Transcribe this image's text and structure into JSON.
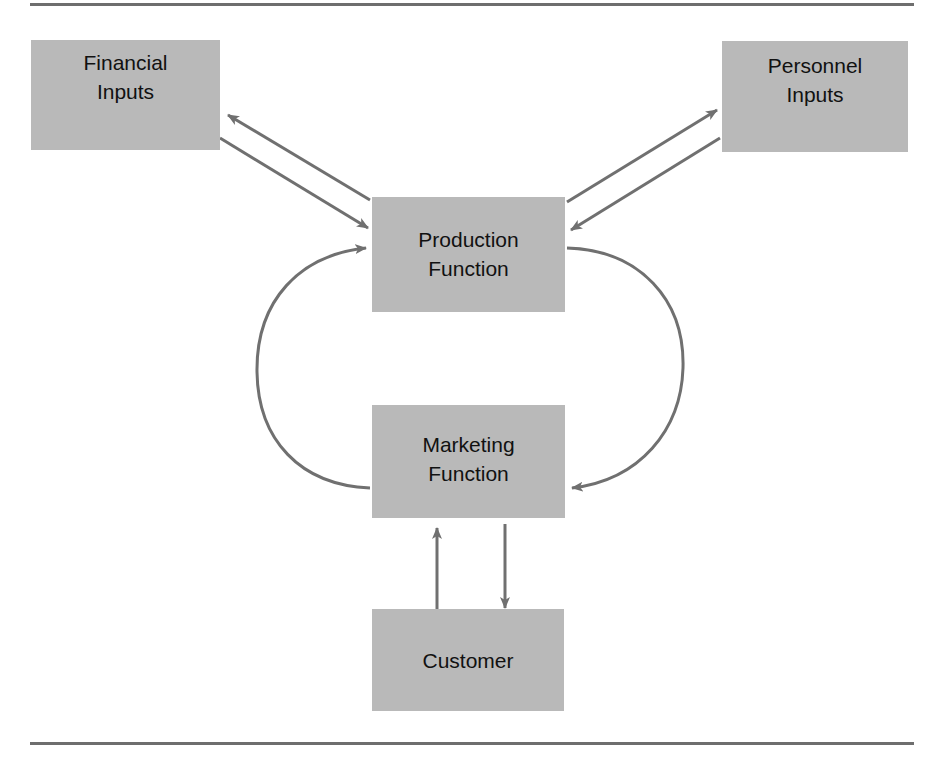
{
  "diagram": {
    "nodes": {
      "financial": {
        "line1": "Financial",
        "line2": "Inputs"
      },
      "personnel": {
        "line1": "Personnel",
        "line2": "Inputs"
      },
      "production": {
        "line1": "Production",
        "line2": "Function"
      },
      "marketing": {
        "line1": "Marketing",
        "line2": "Function"
      },
      "customer": {
        "line1": "Customer"
      }
    },
    "edges": [
      {
        "from": "production",
        "to": "financial"
      },
      {
        "from": "financial",
        "to": "production"
      },
      {
        "from": "production",
        "to": "personnel"
      },
      {
        "from": "personnel",
        "to": "production"
      },
      {
        "from": "production",
        "to": "marketing"
      },
      {
        "from": "marketing",
        "to": "production"
      },
      {
        "from": "customer",
        "to": "marketing"
      },
      {
        "from": "marketing",
        "to": "customer"
      }
    ],
    "colors": {
      "box": "#b9b9b9",
      "arrow": "#707070",
      "rule": "#6e6e6e"
    }
  }
}
